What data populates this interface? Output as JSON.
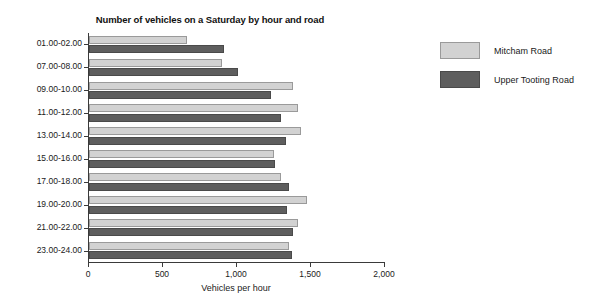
{
  "chart_data": {
    "type": "bar",
    "orientation": "horizontal",
    "title": "Number of vehicles on a Saturday by hour and road",
    "xlabel": "Vehicles per hour",
    "ylabel": "",
    "categories": [
      "01.00-02.00",
      "07.00-08.00",
      "09.00-10.00",
      "11.00-12.00",
      "13.00-14.00",
      "15.00-16.00",
      "17.00-18.00",
      "19.00-20.00",
      "21.00-22.00",
      "23.00-24.00"
    ],
    "series": [
      {
        "name": "Mitcham Road",
        "color": "#d2d2d2",
        "values": [
          660,
          900,
          1380,
          1410,
          1430,
          1250,
          1300,
          1470,
          1410,
          1350
        ]
      },
      {
        "name": "Upper Tooting Road",
        "color": "#5e5e5e",
        "values": [
          910,
          1010,
          1230,
          1300,
          1330,
          1260,
          1350,
          1340,
          1380,
          1370
        ]
      }
    ],
    "xlim": [
      0,
      2000
    ],
    "xticks": [
      0,
      500,
      1000,
      1500,
      2000
    ],
    "xticklabels": [
      "0",
      "500",
      "1,000",
      "1,500",
      "2,000"
    ],
    "grid": false,
    "legend_position": "right"
  },
  "legend": {
    "items": [
      {
        "label": "Mitcham Road",
        "swatch": "light"
      },
      {
        "label": "Upper Tooting Road",
        "swatch": "dark"
      }
    ]
  }
}
